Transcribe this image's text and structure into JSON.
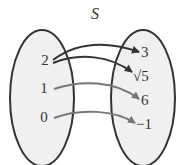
{
  "title": "S",
  "domain_set": {
    "elements": [
      "2",
      "1",
      "0"
    ]
  },
  "range_set": {
    "elements": [
      "3",
      "√5",
      "6",
      "−1"
    ]
  },
  "mappings": [
    {
      "from": "2",
      "to": "3",
      "color": "#333333"
    },
    {
      "from": "2",
      "to": "√5",
      "color": "#333333"
    },
    {
      "from": "1",
      "to": "6",
      "color": "#777777"
    },
    {
      "from": "0",
      "to": "−1",
      "color": "#777777"
    }
  ],
  "colors": {
    "ellipse_fill": "#f0f0f0",
    "ellipse_stroke": "#333333",
    "arrow_dark": "#333333",
    "arrow_light": "#777777"
  }
}
